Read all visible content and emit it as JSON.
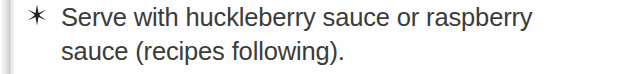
{
  "page": {
    "background_color": "#fefefe",
    "text_color": "#3b3b3b",
    "edge_shadow_color": "#d2d2d2"
  },
  "list_item": {
    "bullet": {
      "icon_name": "six-pointed-star-bullet-icon",
      "glyph": "✶",
      "color": "#222222"
    },
    "lines": [
      "Serve with huckleberry sauce or raspberry",
      "sauce (recipes following)."
    ],
    "full_text": "Serve with huckleberry sauce or raspberry sauce (recipes following)."
  }
}
